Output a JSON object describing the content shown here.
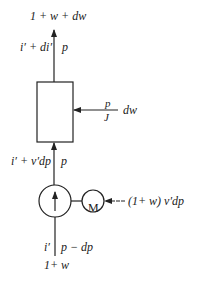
{
  "diagram": {
    "type": "flow-schematic",
    "stroke_color": "#222222",
    "background": "#ffffff",
    "nodes": {
      "box": {
        "shape": "rectangle"
      },
      "pump": {
        "shape": "circle",
        "icon": "up-arrow-icon"
      },
      "motor": {
        "shape": "circle",
        "label": "M"
      }
    },
    "labels": {
      "top_flow": "1 + w + dw",
      "top_left": "i′ + di′",
      "top_right": "p",
      "box_input_num": "p",
      "box_input_den": "J",
      "box_input_label": "dw",
      "mid_left": "i′ + v′dp",
      "mid_right": "p",
      "motor_input": "(1+ w) v′dp",
      "bottom_left": "i′",
      "bottom_right": "p − dp",
      "bottom_flow": "1+ w"
    }
  }
}
